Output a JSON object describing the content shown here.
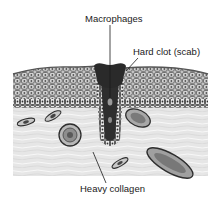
{
  "diagram": {
    "labels": {
      "macrophages": "Macrophages",
      "hard_clot": "Hard clot (scab)",
      "heavy_collagen": "Heavy collagen"
    },
    "colors": {
      "background": "#ffffff",
      "dermis": "#e4e4e4",
      "epidermis": "#b8b8b8",
      "cell_outline": "#3a3a3a",
      "clot": "#2a2a2a",
      "text": "#1a1a1a"
    }
  }
}
